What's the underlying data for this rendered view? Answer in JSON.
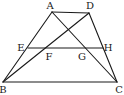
{
  "diagram": {
    "title": "",
    "points": {
      "A": {
        "label": "A",
        "x": 52,
        "y": 12
      },
      "D": {
        "label": "D",
        "x": 89,
        "y": 13
      },
      "E": {
        "label": "E",
        "x": 28,
        "y": 48
      },
      "F": {
        "label": "F",
        "x": 46,
        "y": 48
      },
      "G": {
        "label": "G",
        "x": 84,
        "y": 48
      },
      "H": {
        "label": "H",
        "x": 103,
        "y": 48
      },
      "B": {
        "label": "B",
        "x": 3,
        "y": 82
      },
      "C": {
        "label": "C",
        "x": 117,
        "y": 82
      }
    },
    "segments": [
      [
        "A",
        "D"
      ],
      [
        "A",
        "B"
      ],
      [
        "D",
        "C"
      ],
      [
        "B",
        "C"
      ],
      [
        "A",
        "C"
      ],
      [
        "B",
        "D"
      ],
      [
        "E",
        "H"
      ]
    ],
    "labels": {
      "A": "A",
      "D": "D",
      "E": "E",
      "F": "F",
      "G": "G",
      "H": "H",
      "B": "B",
      "C": "C"
    },
    "colors": {
      "stroke": "#1a1a1a",
      "background": "#ffffff"
    }
  }
}
